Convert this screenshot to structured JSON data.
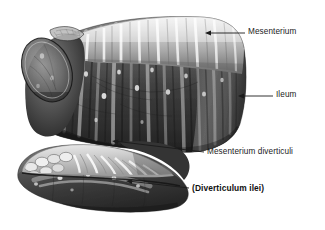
{
  "figure": {
    "background_color": "#ffffff",
    "ink_color": "#1b1b1b"
  },
  "labels": [
    {
      "id": "mesenterium",
      "text": "Mesenterium",
      "bold": false,
      "leader": {
        "x1": 207,
        "y1": 33,
        "x2": 245,
        "y2": 33,
        "arrow": true
      }
    },
    {
      "id": "ileum",
      "text": "Ileum",
      "bold": false,
      "leader": {
        "x1": 240,
        "y1": 96,
        "x2": 273,
        "y2": 96,
        "arrow": true
      }
    },
    {
      "id": "mesenterium-diverticuli",
      "text": "Mesenterium diverticuli",
      "bold": false,
      "leader": {
        "x1": 114,
        "y1": 141,
        "x2": 204,
        "y2": 152,
        "arrow": true
      }
    },
    {
      "id": "diverticulum-ilei",
      "text": "(Diverticulum ilei)",
      "bold": true,
      "leader": {
        "x1": 128,
        "y1": 181,
        "x2": 189,
        "y2": 188,
        "arrow": true
      }
    }
  ],
  "structures": [
    {
      "id": "ileum-loop",
      "name": "Ileum",
      "description": "Large dark intestinal loop occupying the upper portion"
    },
    {
      "id": "mesenterium",
      "name": "Mesenterium",
      "description": "Light fan-shaped membrane with vertical folds along the top edge of the ileum"
    },
    {
      "id": "diverticulum",
      "name": "Diverticulum ilei",
      "description": "Finger-like blind pouch projecting from the lower left of the ileum"
    },
    {
      "id": "mesenterium-diverticuli",
      "name": "Mesenterium diverticuli",
      "description": "Small pale mesentery with lobular folds attached along the diverticulum"
    },
    {
      "id": "cut-edge",
      "name": "Cut edge",
      "description": "Sutured oval cut surface at the left end of the ileum"
    }
  ],
  "palette": {
    "tissue_dark": "#3a3a3a",
    "tissue_mid": "#6e6e6e",
    "tissue_light": "#c9c9c9",
    "mesentery_light": "#d8d8d8",
    "highlight": "#f2f2f2",
    "outline": "#1a1a1a"
  }
}
